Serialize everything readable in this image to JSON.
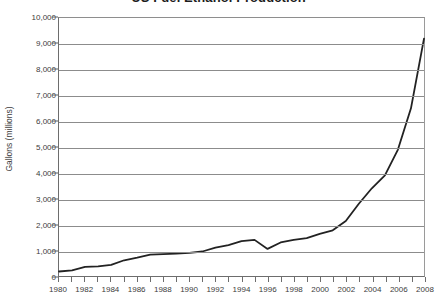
{
  "chart_data": {
    "type": "line",
    "title": "US Fuel Ethanol Production",
    "xlabel": "",
    "ylabel": "Gallons (millions)",
    "xlim": [
      1980,
      2008
    ],
    "ylim": [
      0,
      10000
    ],
    "grid": true,
    "legend": "none",
    "ytick_labels": [
      "10,000",
      "9,000",
      "8,000",
      "7,000",
      "6,000",
      "5,000",
      "4,000",
      "3,000",
      "2,000",
      "1,000",
      "0"
    ],
    "ytick_values": [
      10000,
      9000,
      8000,
      7000,
      6000,
      5000,
      4000,
      3000,
      2000,
      1000,
      0
    ],
    "xtick_labels": [
      "1980",
      "1982",
      "1984",
      "1986",
      "1988",
      "1990",
      "1992",
      "1994",
      "1996",
      "1998",
      "2000",
      "2002",
      "2004",
      "2006",
      "2008"
    ],
    "xtick_values": [
      1980,
      1982,
      1984,
      1986,
      1988,
      1990,
      1992,
      1994,
      1996,
      1998,
      2000,
      2002,
      2004,
      2006,
      2008
    ],
    "xminor_values": [
      1980,
      1981,
      1982,
      1983,
      1984,
      1985,
      1986,
      1987,
      1988,
      1989,
      1990,
      1991,
      1992,
      1993,
      1994,
      1995,
      1996,
      1997,
      1998,
      1999,
      2000,
      2001,
      2002,
      2003,
      2004,
      2005,
      2006,
      2007,
      2008
    ],
    "series": [
      {
        "name": "US Fuel Ethanol Production",
        "color": "#222222",
        "x": [
          1980,
          1981,
          1982,
          1983,
          1984,
          1985,
          1986,
          1987,
          1988,
          1989,
          1990,
          1991,
          1992,
          1993,
          1994,
          1995,
          1996,
          1997,
          1998,
          1999,
          2000,
          2001,
          2002,
          2003,
          2004,
          2005,
          2006,
          2007,
          2008
        ],
        "values": [
          175,
          215,
          350,
          375,
          430,
          610,
          710,
          830,
          845,
          870,
          900,
          950,
          1100,
          1200,
          1350,
          1400,
          1050,
          1300,
          1400,
          1470,
          1630,
          1770,
          2130,
          2800,
          3400,
          3900,
          4900,
          6500,
          9200
        ]
      }
    ]
  },
  "axis": {
    "y_title": "Gallons (millions)"
  }
}
